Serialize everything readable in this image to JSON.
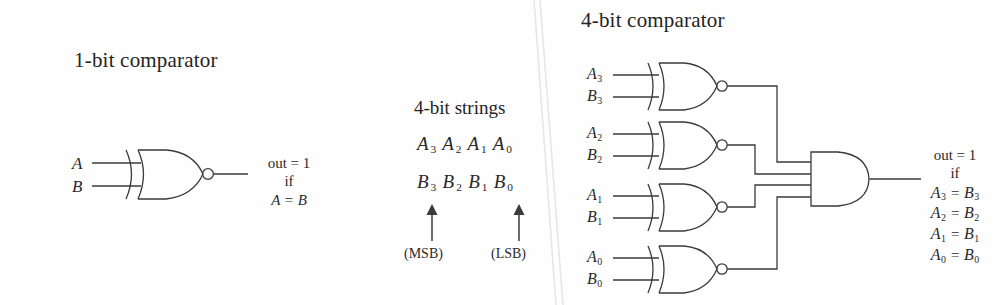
{
  "figure": {
    "background_color": "#fefefe",
    "ink_color": "#3a3a3a",
    "artifact_color": "#e8e8e8"
  },
  "panel_one_bit": {
    "title": "1-bit comparator",
    "inputs": [
      {
        "label": "A"
      },
      {
        "label": "B"
      }
    ],
    "gate": {
      "type": "xnor-gate",
      "name": "xnor-gate-1bit"
    },
    "output_text": {
      "line1": "out = 1",
      "line2": "if",
      "line3": "A = B"
    }
  },
  "panel_strings": {
    "heading": "4-bit strings",
    "row_a": {
      "bits": [
        "A3",
        "A2",
        "A1",
        "A0"
      ]
    },
    "row_b": {
      "bits": [
        "B3",
        "B2",
        "B1",
        "B0"
      ]
    },
    "annotations": [
      {
        "label": "(MSB)",
        "name": "msb-annotation"
      },
      {
        "label": "(LSB)",
        "name": "lsb-annotation"
      }
    ]
  },
  "panel_four_bit": {
    "title": "4-bit comparator",
    "gates": [
      {
        "name": "xnor-gate-bit3",
        "inputs": [
          "A3",
          "B3"
        ]
      },
      {
        "name": "xnor-gate-bit2",
        "inputs": [
          "A2",
          "B2"
        ]
      },
      {
        "name": "xnor-gate-bit1",
        "inputs": [
          "A1",
          "B1"
        ]
      },
      {
        "name": "xnor-gate-bit0",
        "inputs": [
          "A0",
          "B0"
        ]
      }
    ],
    "and_gate": {
      "name": "and-gate-4input",
      "input_count": 4
    },
    "output_text": {
      "line1": "out = 1",
      "line2": "if",
      "eq3": "A3 = B3",
      "eq2": "A2 = B2",
      "eq1": "A1 = B1",
      "eq0": "A0 = B0"
    }
  },
  "labels": {
    "A": "A",
    "B": "B",
    "A3": "A",
    "A2": "A",
    "A1": "A",
    "A0": "A",
    "B3": "B",
    "B2": "B",
    "B1": "B",
    "B0": "B",
    "s3": "3",
    "s2": "2",
    "s1": "1",
    "s0": "0",
    "eq": "=",
    "out_eq_1": "out = 1",
    "if": "if"
  }
}
